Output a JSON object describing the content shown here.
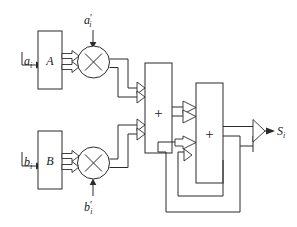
{
  "diagram": {
    "blocks": [
      {
        "id": "block-a",
        "label": "A",
        "name": "coefficient-block-a"
      },
      {
        "id": "block-b",
        "label": "B",
        "name": "coefficient-block-b"
      },
      {
        "id": "mult-a",
        "label": "×",
        "name": "multiplier-a"
      },
      {
        "id": "mult-b",
        "label": "×",
        "name": "multiplier-b"
      },
      {
        "id": "adder-1",
        "label": "+",
        "name": "adder-first-stage"
      },
      {
        "id": "adder-2",
        "label": "+",
        "name": "adder-second-stage"
      }
    ],
    "inputs": [
      {
        "id": "input-ai",
        "var": "a",
        "prime": "",
        "sub": "i",
        "name": "input-a-i"
      },
      {
        "id": "input-bi",
        "var": "b",
        "prime": "",
        "sub": "i",
        "name": "input-b-i"
      },
      {
        "id": "input-ai-prime",
        "var": "a",
        "prime": "′",
        "sub": "i",
        "name": "input-a-prime-i"
      },
      {
        "id": "input-bi-prime",
        "var": "b",
        "prime": "′",
        "sub": "i",
        "name": "input-b-prime-i"
      }
    ],
    "outputs": [
      {
        "id": "output-si",
        "var": "S",
        "prime": "",
        "sub": "i",
        "name": "output-s-i"
      }
    ],
    "colors": {
      "line": "#2b2b2b",
      "text": "#1a1a1a",
      "background": "#ffffff"
    }
  }
}
